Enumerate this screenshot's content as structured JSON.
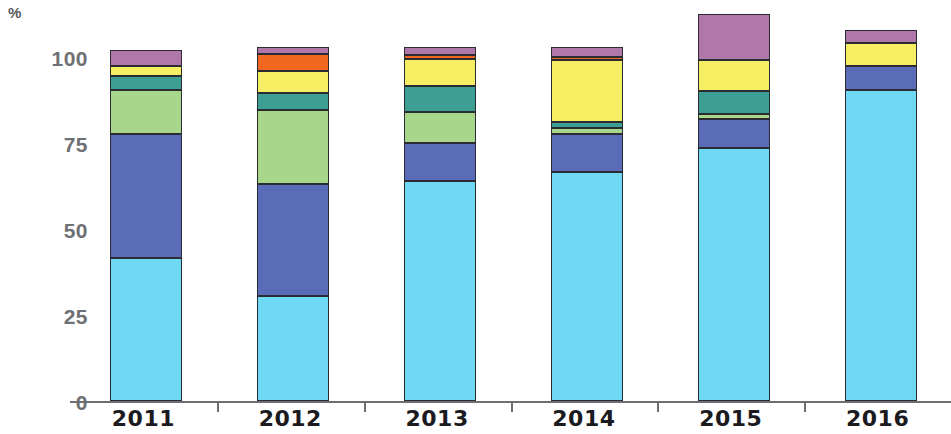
{
  "chart_data": {
    "type": "bar",
    "subtype": "stacked-bar-100-percent",
    "title": "",
    "subtitle": "",
    "xlabel": "",
    "ylabel": "%",
    "unit_label": "%",
    "ylim": [
      0,
      100
    ],
    "yticks": [
      0,
      25,
      50,
      75,
      100
    ],
    "ytick_labels": [
      "0",
      "25",
      "50",
      "75",
      "100"
    ],
    "grid": false,
    "legend": "none",
    "categories": [
      "2011",
      "2012",
      "2013",
      "2014",
      "2015",
      "2016"
    ],
    "series": [
      {
        "name": "Series 1",
        "color": "#6FD8F2",
        "values": [
          41.5,
          30.5,
          64.0,
          66.5,
          73.5,
          90.5
        ]
      },
      {
        "name": "Series 2",
        "color": "#5A6BB8",
        "values": [
          36.0,
          32.5,
          11.0,
          11.0,
          8.5,
          7.0
        ]
      },
      {
        "name": "Series 3",
        "color": "#A8D68A",
        "values": [
          13.0,
          21.5,
          9.0,
          2.0,
          1.5,
          0.0
        ]
      },
      {
        "name": "Series 4",
        "color": "#3D9E93",
        "values": [
          4.0,
          5.0,
          7.5,
          1.5,
          6.5,
          0.0
        ]
      },
      {
        "name": "Series 5",
        "color": "#F7EF63",
        "values": [
          3.0,
          6.5,
          8.0,
          18.0,
          9.0,
          6.5
        ]
      },
      {
        "name": "Series 6",
        "color": "#F0681F",
        "values": [
          0.0,
          5.0,
          1.0,
          1.0,
          0.0,
          0.0
        ]
      },
      {
        "name": "Series 7",
        "color": "#B078A8",
        "values": [
          4.5,
          2.0,
          2.5,
          3.0,
          13.5,
          4.0
        ]
      }
    ]
  }
}
